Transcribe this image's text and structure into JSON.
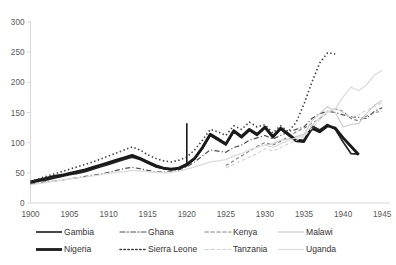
{
  "chart_data": {
    "type": "line",
    "title": "",
    "subtitle": "",
    "xlabel": "",
    "ylabel": "",
    "xlim": [
      1900,
      1946
    ],
    "ylim": [
      0,
      300
    ],
    "yticks": [
      0,
      50,
      100,
      150,
      200,
      250,
      300
    ],
    "xticks": [
      1900,
      1905,
      1910,
      1915,
      1920,
      1925,
      1930,
      1935,
      1940,
      1945
    ],
    "grid": false,
    "legend_position": "bottom",
    "x": [
      1900,
      1901,
      1902,
      1903,
      1904,
      1905,
      1906,
      1907,
      1908,
      1909,
      1910,
      1911,
      1912,
      1913,
      1914,
      1915,
      1916,
      1917,
      1918,
      1919,
      1920,
      1921,
      1922,
      1923,
      1924,
      1925,
      1926,
      1927,
      1928,
      1929,
      1930,
      1931,
      1932,
      1933,
      1934,
      1935,
      1936,
      1937,
      1938,
      1939,
      1940,
      1941,
      1942,
      1943,
      1944,
      1945
    ],
    "series": [
      {
        "name": "Gambia",
        "style": "solid",
        "color": "#262626",
        "width": 1.7,
        "values": [
          33,
          36,
          38,
          41,
          44,
          47,
          49,
          52,
          56,
          60,
          64,
          68,
          72,
          76,
          72,
          66,
          60,
          57,
          55,
          57,
          62,
          73,
          90,
          112,
          104,
          96,
          118,
          108,
          120,
          112,
          124,
          108,
          122,
          112,
          102,
          101,
          128,
          121,
          130,
          122,
          101,
          82,
          81,
          null,
          null,
          null
        ]
      },
      {
        "name": "Ghana",
        "style": "dashdot",
        "color": "#4d4d4d",
        "width": 1.2,
        "values": [
          31,
          33,
          35,
          36,
          38,
          40,
          42,
          44,
          46,
          48,
          51,
          54,
          57,
          59,
          57,
          54,
          52,
          51,
          52,
          55,
          60,
          68,
          78,
          88,
          86,
          84,
          92,
          96,
          104,
          108,
          112,
          106,
          112,
          118,
          122,
          126,
          140,
          148,
          152,
          150,
          146,
          143,
          142,
          140,
          152,
          158
        ]
      },
      {
        "name": "Kenya",
        "style": "dashed",
        "color": "#808080",
        "width": 1.1,
        "values": [
          null,
          null,
          null,
          null,
          null,
          null,
          null,
          null,
          null,
          null,
          null,
          null,
          null,
          null,
          null,
          null,
          null,
          null,
          null,
          null,
          null,
          null,
          null,
          null,
          null,
          62,
          70,
          78,
          86,
          94,
          100,
          96,
          102,
          110,
          118,
          124,
          132,
          140,
          150,
          156,
          152,
          140,
          136,
          144,
          150,
          152
        ]
      },
      {
        "name": "Malawi",
        "style": "solid",
        "color": "#c9c9c9",
        "width": 1.1,
        "values": [
          null,
          null,
          null,
          null,
          null,
          null,
          null,
          null,
          null,
          null,
          null,
          null,
          null,
          null,
          null,
          null,
          null,
          null,
          null,
          null,
          null,
          null,
          null,
          null,
          null,
          null,
          null,
          null,
          null,
          null,
          96,
          98,
          104,
          106,
          110,
          114,
          136,
          148,
          160,
          150,
          126,
          130,
          132,
          148,
          162,
          170
        ]
      },
      {
        "name": "Nigeria",
        "style": "solid",
        "color": "#1a1a1a",
        "width": 2.8,
        "values": [
          35,
          38,
          41,
          44,
          46,
          49,
          52,
          55,
          59,
          63,
          67,
          71,
          75,
          79,
          74,
          68,
          62,
          58,
          56,
          58,
          64,
          74,
          92,
          114,
          106,
          98,
          120,
          110,
          122,
          114,
          126,
          110,
          124,
          114,
          104,
          103,
          124,
          118,
          128,
          124,
          108,
          94,
          80,
          null,
          null,
          null
        ]
      },
      {
        "name": "Sierra Leone",
        "style": "dotted",
        "color": "#404040",
        "width": 1.6,
        "values": [
          36,
          40,
          44,
          48,
          52,
          56,
          60,
          64,
          68,
          73,
          78,
          83,
          88,
          93,
          88,
          80,
          74,
          70,
          68,
          71,
          76,
          88,
          104,
          122,
          118,
          112,
          128,
          122,
          134,
          126,
          130,
          116,
          128,
          118,
          134,
          164,
          200,
          232,
          249,
          247,
          null,
          null,
          null,
          null,
          null,
          null
        ]
      },
      {
        "name": "Tanzania",
        "style": "dashed",
        "color": "#d0d0d0",
        "width": 1.1,
        "values": [
          null,
          null,
          null,
          null,
          null,
          null,
          null,
          null,
          null,
          null,
          null,
          null,
          null,
          null,
          null,
          null,
          null,
          null,
          null,
          null,
          null,
          null,
          null,
          null,
          null,
          58,
          64,
          70,
          76,
          82,
          90,
          86,
          92,
          98,
          104,
          110,
          124,
          138,
          152,
          158,
          150,
          142,
          146,
          154,
          160,
          166
        ]
      },
      {
        "name": "Uganda",
        "style": "solid",
        "color": "#dcdcdc",
        "width": 1.3,
        "values": [
          30,
          32,
          34,
          36,
          38,
          40,
          42,
          43,
          45,
          47,
          49,
          51,
          52,
          54,
          53,
          52,
          51,
          50,
          51,
          53,
          56,
          60,
          64,
          68,
          70,
          72,
          78,
          82,
          88,
          92,
          96,
          92,
          98,
          104,
          108,
          112,
          128,
          142,
          150,
          156,
          176,
          192,
          186,
          196,
          212,
          220
        ]
      }
    ],
    "annotations": [
      {
        "name": "spike-marker",
        "type": "line",
        "x": 1920,
        "y_from": 62,
        "y_to": 132,
        "color": "#1a1a1a",
        "width": 1.6
      }
    ]
  },
  "legend": {
    "rows": [
      [
        {
          "label": "Gambia",
          "series": "Gambia"
        },
        {
          "label": "Ghana",
          "series": "Ghana"
        },
        {
          "label": "Kenya",
          "series": "Kenya"
        },
        {
          "label": "Malawi",
          "series": "Malawi"
        }
      ],
      [
        {
          "label": "Nigeria",
          "series": "Nigeria"
        },
        {
          "label": "Sierra Leone",
          "series": "Sierra Leone"
        },
        {
          "label": "Tanzania",
          "series": "Tanzania"
        },
        {
          "label": "Uganda",
          "series": "Uganda"
        }
      ]
    ]
  },
  "colors": {
    "axis": "#d9d9d9",
    "tick_text": "#595959",
    "legend_text": "#333333",
    "background": "#ffffff"
  }
}
